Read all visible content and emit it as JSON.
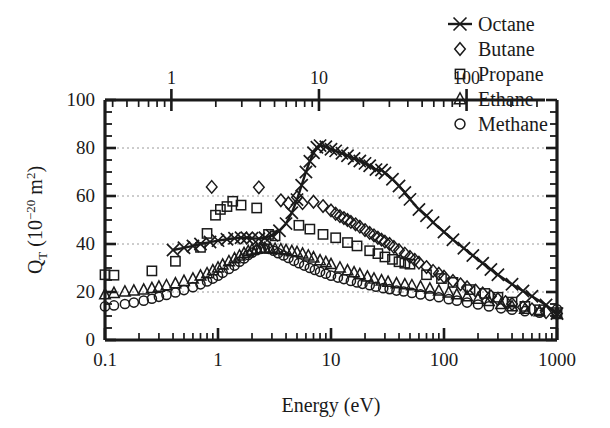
{
  "figure": {
    "background": "#ffffff",
    "ink": "#1a1a1a",
    "grid_color": "#9a9a9a"
  },
  "axes": {
    "x_bottom": {
      "label": "Energy (eV)",
      "ticks": [
        "0.1",
        "1",
        "10",
        "100",
        "1000"
      ],
      "min": 0.1,
      "max": 1000,
      "scale": "log"
    },
    "x_top": {
      "label": "",
      "ticks": [
        "1",
        "10",
        "100"
      ],
      "min": 0.355,
      "max": 340,
      "scale": "log"
    },
    "y": {
      "label_main": "Q",
      "label_sub": "T",
      "label_unit_open": " (10",
      "label_exp": "−20",
      "label_unit_close": " m",
      "label_exp2": "2",
      "label_paren": ")",
      "ticks": [
        "0",
        "20",
        "40",
        "60",
        "80",
        "100"
      ],
      "min": 0,
      "max": 100,
      "scale": "linear",
      "gridlines": [
        20,
        40,
        60,
        80
      ]
    }
  },
  "legend": {
    "position": "top-right",
    "items": [
      {
        "label": "Octane",
        "marker": "line-cross",
        "marker_glyph": "x-marker-icon"
      },
      {
        "label": "Butane",
        "marker": "diamond",
        "marker_glyph": "diamond-marker-icon"
      },
      {
        "label": "Propane",
        "marker": "square",
        "marker_glyph": "square-marker-icon"
      },
      {
        "label": "Ethane",
        "marker": "triangle",
        "marker_glyph": "triangle-marker-icon"
      },
      {
        "label": "Methane",
        "marker": "circle",
        "marker_glyph": "circle-marker-icon"
      }
    ]
  },
  "chart_data": {
    "type": "line",
    "title": "",
    "xlabel": "Energy (eV)",
    "ylabel": "Q_T (10^-20 m^2)",
    "xscale": "log",
    "yscale": "linear",
    "xlim": [
      0.1,
      1000
    ],
    "ylim": [
      0,
      100
    ],
    "grid": "horizontal-dotted",
    "legend_position": "top-right",
    "series": [
      {
        "name": "Octane",
        "marker": "cross",
        "line": true,
        "points": [
          [
            0.4,
            37.5
          ],
          [
            0.5,
            38.4
          ],
          [
            0.6,
            39.2
          ],
          [
            0.7,
            40.0
          ],
          [
            0.85,
            40.8
          ],
          [
            1.0,
            41.4
          ],
          [
            1.2,
            42.0
          ],
          [
            1.4,
            42.4
          ],
          [
            1.6,
            42.6
          ],
          [
            1.8,
            42.6
          ],
          [
            2.0,
            42.4
          ],
          [
            2.3,
            42.2
          ],
          [
            2.6,
            42.6
          ],
          [
            3.0,
            43.6
          ],
          [
            3.5,
            45.5
          ],
          [
            4.0,
            48.5
          ],
          [
            4.5,
            53.0
          ],
          [
            5.0,
            58.5
          ],
          [
            5.5,
            64.5
          ],
          [
            6.0,
            70.0
          ],
          [
            6.5,
            74.5
          ],
          [
            7.0,
            78.0
          ],
          [
            7.5,
            80.3
          ],
          [
            8.0,
            81.0
          ],
          [
            9.0,
            80.5
          ],
          [
            10.0,
            79.5
          ],
          [
            11.0,
            78.8
          ],
          [
            12.5,
            77.8
          ],
          [
            14.0,
            76.8
          ],
          [
            16.0,
            75.6
          ],
          [
            18.0,
            74.6
          ],
          [
            20.0,
            73.6
          ],
          [
            22.0,
            72.6
          ],
          [
            25.0,
            71.0
          ],
          [
            28.0,
            70.8
          ],
          [
            30.0,
            69.6
          ],
          [
            35.0,
            67.0
          ],
          [
            40.0,
            64.2
          ],
          [
            45.0,
            61.5
          ],
          [
            50.0,
            58.6
          ],
          [
            60.0,
            54.4
          ],
          [
            70.0,
            51.8
          ],
          [
            80.0,
            49.0
          ],
          [
            100.0,
            45.0
          ],
          [
            120.0,
            41.8
          ],
          [
            150.0,
            38.2
          ],
          [
            180.0,
            35.2
          ],
          [
            220.0,
            32.0
          ],
          [
            260.0,
            29.4
          ],
          [
            300.0,
            27.2
          ],
          [
            400.0,
            23.2
          ],
          [
            500.0,
            20.4
          ],
          [
            600.0,
            18.2
          ],
          [
            800.0,
            14.6
          ],
          [
            1000.0,
            11.0
          ]
        ]
      },
      {
        "name": "Butane",
        "marker": "diamond",
        "line": false,
        "points": [
          [
            0.88,
            63.8
          ],
          [
            2.3,
            63.6
          ],
          [
            3.6,
            58.2
          ],
          [
            4.2,
            57.0
          ],
          [
            5.0,
            59.5
          ],
          [
            5.6,
            57.0
          ],
          [
            7.0,
            57.6
          ],
          [
            8.5,
            55.8
          ],
          [
            10.0,
            54.0
          ],
          [
            11.0,
            52.6
          ],
          [
            12.0,
            51.6
          ],
          [
            13.0,
            50.8
          ],
          [
            14.0,
            50.0
          ],
          [
            15.0,
            49.2
          ],
          [
            16.5,
            48.2
          ],
          [
            18.0,
            47.2
          ],
          [
            20.0,
            45.8
          ],
          [
            22.0,
            44.6
          ],
          [
            24.0,
            43.6
          ],
          [
            26.0,
            42.6
          ],
          [
            28.0,
            41.8
          ],
          [
            30.0,
            41.0
          ],
          [
            33.0,
            40.0
          ],
          [
            36.0,
            38.8
          ],
          [
            40.0,
            37.4
          ],
          [
            45.0,
            36.0
          ],
          [
            50.0,
            34.6
          ],
          [
            55.0,
            33.4
          ],
          [
            60.0,
            32.2
          ],
          [
            70.0,
            30.4
          ],
          [
            80.0,
            28.8
          ],
          [
            90.0,
            27.6
          ],
          [
            100.0,
            26.4
          ],
          [
            120.0,
            24.6
          ],
          [
            140.0,
            23.2
          ],
          [
            160.0,
            22.0
          ],
          [
            190.0,
            20.6
          ],
          [
            220.0,
            19.4
          ],
          [
            260.0,
            18.2
          ],
          [
            300.0,
            17.0
          ],
          [
            350.0,
            15.8
          ],
          [
            400.0,
            15.0
          ],
          [
            500.0,
            13.6
          ],
          [
            600.0,
            12.8
          ],
          [
            800.0,
            11.6
          ],
          [
            1000.0,
            11.0
          ]
        ]
      },
      {
        "name": "Propane",
        "marker": "square",
        "line": false,
        "points": [
          [
            0.1,
            27.2
          ],
          [
            0.12,
            27.0
          ],
          [
            0.26,
            28.8
          ],
          [
            0.42,
            32.8
          ],
          [
            0.7,
            38.6
          ],
          [
            0.8,
            44.4
          ],
          [
            0.95,
            52.0
          ],
          [
            1.05,
            54.4
          ],
          [
            1.2,
            55.6
          ],
          [
            1.35,
            57.8
          ],
          [
            1.6,
            56.2
          ],
          [
            2.2,
            55.0
          ],
          [
            2.8,
            44.0
          ],
          [
            3.2,
            43.4
          ],
          [
            5.2,
            47.8
          ],
          [
            6.5,
            46.2
          ],
          [
            8.5,
            44.0
          ],
          [
            11.0,
            42.6
          ],
          [
            14.0,
            40.6
          ],
          [
            17.0,
            39.2
          ],
          [
            22.0,
            37.2
          ],
          [
            26.0,
            36.0
          ],
          [
            30.0,
            34.6
          ],
          [
            35.0,
            33.6
          ],
          [
            40.0,
            32.6
          ],
          [
            45.0,
            32.0
          ],
          [
            50.0,
            31.6
          ],
          [
            70.0,
            27.2
          ],
          [
            95.0,
            25.6
          ],
          [
            120.0,
            24.0
          ],
          [
            170.0,
            21.0
          ],
          [
            230.0,
            19.4
          ],
          [
            300.0,
            17.8
          ],
          [
            400.0,
            15.8
          ],
          [
            520.0,
            14.0
          ],
          [
            700.0,
            12.6
          ],
          [
            1000.0,
            11.4
          ]
        ]
      },
      {
        "name": "Ethane",
        "marker": "triangle",
        "line": false,
        "points": [
          [
            0.1,
            19.0
          ],
          [
            0.12,
            19.6
          ],
          [
            0.15,
            20.2
          ],
          [
            0.18,
            20.6
          ],
          [
            0.22,
            21.0
          ],
          [
            0.26,
            21.6
          ],
          [
            0.3,
            22.2
          ],
          [
            0.35,
            22.8
          ],
          [
            0.42,
            23.6
          ],
          [
            0.5,
            24.6
          ],
          [
            0.6,
            25.6
          ],
          [
            0.7,
            26.8
          ],
          [
            0.8,
            27.8
          ],
          [
            0.9,
            29.0
          ],
          [
            1.0,
            30.2
          ],
          [
            1.1,
            31.4
          ],
          [
            1.25,
            32.8
          ],
          [
            1.4,
            34.0
          ],
          [
            1.55,
            35.2
          ],
          [
            1.7,
            36.2
          ],
          [
            1.85,
            37.0
          ],
          [
            2.0,
            37.6
          ],
          [
            2.2,
            38.0
          ],
          [
            2.4,
            38.2
          ],
          [
            2.6,
            38.4
          ],
          [
            2.9,
            38.2
          ],
          [
            3.2,
            38.0
          ],
          [
            3.6,
            37.8
          ],
          [
            4.0,
            37.4
          ],
          [
            4.5,
            37.0
          ],
          [
            5.0,
            36.6
          ],
          [
            5.6,
            36.0
          ],
          [
            6.3,
            35.2
          ],
          [
            7.0,
            34.4
          ],
          [
            8.0,
            33.2
          ],
          [
            9.0,
            32.4
          ],
          [
            10.0,
            31.6
          ],
          [
            12.0,
            30.2
          ],
          [
            14.0,
            29.0
          ],
          [
            16.0,
            28.2
          ],
          [
            18.0,
            27.4
          ],
          [
            21.0,
            26.4
          ],
          [
            24.0,
            25.6
          ],
          [
            28.0,
            24.8
          ],
          [
            32.0,
            24.2
          ],
          [
            38.0,
            23.6
          ],
          [
            45.0,
            23.2
          ],
          [
            52.0,
            22.8
          ],
          [
            62.0,
            22.2
          ],
          [
            75.0,
            21.4
          ],
          [
            90.0,
            20.6
          ],
          [
            110.0,
            19.8
          ],
          [
            130.0,
            19.0
          ],
          [
            160.0,
            18.2
          ],
          [
            200.0,
            17.2
          ],
          [
            250.0,
            16.2
          ],
          [
            320.0,
            15.0
          ],
          [
            400.0,
            14.0
          ],
          [
            520.0,
            13.0
          ],
          [
            700.0,
            12.0
          ],
          [
            1000.0,
            10.8
          ]
        ]
      },
      {
        "name": "Methane",
        "marker": "circle",
        "line": false,
        "points": [
          [
            0.1,
            14.0
          ],
          [
            0.12,
            14.4
          ],
          [
            0.15,
            15.0
          ],
          [
            0.18,
            15.6
          ],
          [
            0.22,
            16.4
          ],
          [
            0.26,
            17.2
          ],
          [
            0.3,
            18.0
          ],
          [
            0.35,
            18.8
          ],
          [
            0.42,
            19.8
          ],
          [
            0.5,
            20.8
          ],
          [
            0.6,
            22.0
          ],
          [
            0.7,
            23.2
          ],
          [
            0.8,
            24.4
          ],
          [
            0.9,
            25.6
          ],
          [
            1.0,
            26.8
          ],
          [
            1.1,
            28.0
          ],
          [
            1.25,
            29.6
          ],
          [
            1.4,
            31.0
          ],
          [
            1.55,
            32.6
          ],
          [
            1.7,
            34.0
          ],
          [
            1.85,
            35.4
          ],
          [
            2.0,
            36.4
          ],
          [
            2.2,
            37.4
          ],
          [
            2.4,
            38.0
          ],
          [
            2.6,
            38.2
          ],
          [
            2.8,
            38.0
          ],
          [
            3.1,
            37.2
          ],
          [
            3.4,
            36.2
          ],
          [
            3.8,
            35.2
          ],
          [
            4.2,
            34.2
          ],
          [
            4.7,
            33.0
          ],
          [
            5.2,
            32.0
          ],
          [
            5.8,
            31.0
          ],
          [
            6.5,
            30.0
          ],
          [
            7.2,
            29.2
          ],
          [
            8.0,
            28.4
          ],
          [
            9.0,
            27.6
          ],
          [
            10.0,
            26.8
          ],
          [
            11.5,
            26.0
          ],
          [
            13.0,
            25.4
          ],
          [
            15.0,
            24.6
          ],
          [
            17.0,
            24.0
          ],
          [
            19.0,
            23.4
          ],
          [
            22.0,
            22.8
          ],
          [
            25.0,
            22.2
          ],
          [
            29.0,
            21.6
          ],
          [
            33.0,
            21.2
          ],
          [
            38.0,
            20.6
          ],
          [
            44.0,
            20.2
          ],
          [
            52.0,
            19.6
          ],
          [
            62.0,
            19.0
          ],
          [
            75.0,
            18.4
          ],
          [
            90.0,
            17.8
          ],
          [
            110.0,
            17.0
          ],
          [
            130.0,
            16.4
          ],
          [
            160.0,
            15.6
          ],
          [
            200.0,
            14.8
          ],
          [
            250.0,
            14.0
          ],
          [
            320.0,
            13.2
          ],
          [
            400.0,
            12.6
          ],
          [
            520.0,
            12.0
          ],
          [
            700.0,
            11.4
          ],
          [
            1000.0,
            12.8
          ]
        ]
      }
    ]
  }
}
